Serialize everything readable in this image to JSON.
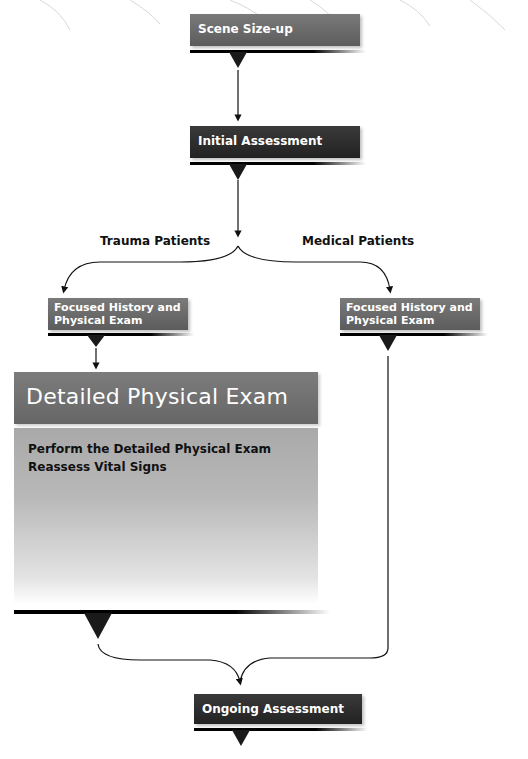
{
  "diagram": {
    "nodes": {
      "scene_sizeup": {
        "label": "Scene Size-up"
      },
      "initial_assessment": {
        "label": "Initial Assessment"
      },
      "focused_trauma": {
        "line1": "Focused History and",
        "line2": "Physical Exam"
      },
      "focused_medical": {
        "line1": "Focused History and",
        "line2": "Physical Exam"
      },
      "detailed_exam": {
        "title": "Detailed Physical Exam",
        "items": [
          "Perform the Detailed Physical Exam",
          "Reassess Vital Signs"
        ]
      },
      "ongoing_assessment": {
        "label": "Ongoing Assessment"
      }
    },
    "branches": {
      "trauma": "Trauma Patients",
      "medical": "Medical Patients"
    },
    "colors": {
      "box_mid": "#6e6e6e",
      "box_dark": "#2a2a2a",
      "accent_bar": "#000000",
      "detail_body": "#b0b0b0"
    }
  }
}
